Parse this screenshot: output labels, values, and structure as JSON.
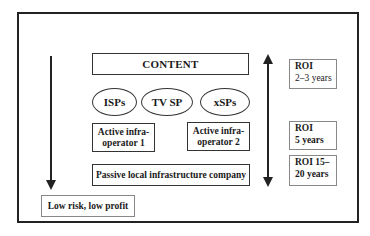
{
  "diagram": {
    "content_box": {
      "label": "CONTENT"
    },
    "service_providers": [
      {
        "label": "ISPs"
      },
      {
        "label": "TV SP"
      },
      {
        "label": "xSPs"
      }
    ],
    "active_operators": [
      {
        "line1": "Active infra-",
        "line2": "operator 1"
      },
      {
        "line1": "Active infra-",
        "line2": "operator 2"
      }
    ],
    "passive_box": {
      "label": "Passive local infrastructure company"
    },
    "roi_boxes": [
      {
        "line1": "ROI",
        "line2": "2–3 years"
      },
      {
        "line1": "ROI",
        "line2": "5 years"
      },
      {
        "line1": "ROI 15–",
        "line2": "20 years"
      }
    ],
    "risk_box": {
      "label": "Low risk, low profit"
    },
    "arrows": {
      "left": "down-arrow",
      "right": "bidirectional-vertical-arrow"
    },
    "colors": {
      "stroke": "#222222",
      "background": "#ffffff"
    }
  }
}
